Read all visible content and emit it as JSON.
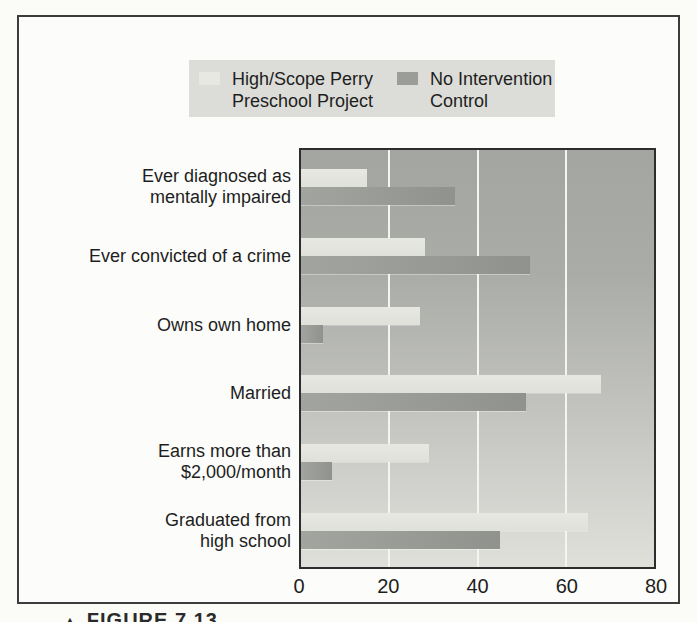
{
  "figure": {
    "caption_arrow": "▲",
    "caption_text": "FIGURE 7.13"
  },
  "legend": {
    "entries": [
      {
        "lines": [
          "High/Scope Perry",
          "Preschool Project"
        ],
        "swatch_color": "#e7e8e2"
      },
      {
        "lines": [
          "No Intervention",
          "Control"
        ],
        "swatch_color": "#9b9d99"
      }
    ],
    "background": "#dcdcd8"
  },
  "chart_data": {
    "type": "bar",
    "orientation": "horizontal",
    "title": "",
    "xlabel": "",
    "ylabel": "",
    "units": "percent",
    "categories": [
      [
        "Ever diagnosed as",
        "mentally impaired"
      ],
      [
        "Ever convicted of a crime"
      ],
      [
        "Owns own home"
      ],
      [
        "Married"
      ],
      [
        "Earns more than",
        "$2,000/month"
      ],
      [
        "Graduated from",
        "high school"
      ]
    ],
    "series": [
      {
        "name": "High/Scope Perry Preschool Project",
        "color": "#e7e8e2",
        "values": [
          15,
          28,
          27,
          68,
          29,
          65
        ]
      },
      {
        "name": "No Intervention Control",
        "color": "#9b9d99",
        "values": [
          35,
          52,
          5,
          51,
          7,
          45
        ]
      }
    ],
    "xlim": [
      0,
      80
    ],
    "xticks": [
      0,
      20,
      40,
      60,
      80
    ],
    "gridlines": [
      20,
      40,
      60
    ],
    "grid_color": "#f4f4f0",
    "plot_bg_top": "#a3a5a1",
    "plot_bg_bottom": "#e0e0db",
    "legend_position": "top"
  }
}
